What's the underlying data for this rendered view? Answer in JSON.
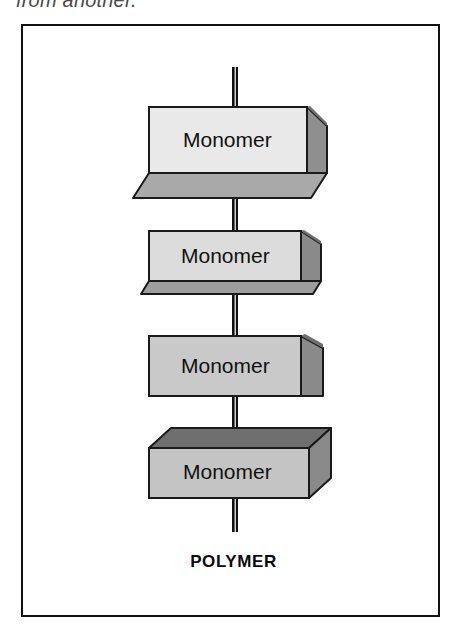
{
  "figure": {
    "caption_above": "from another.",
    "bottom_label": "POLYMER",
    "frame": {
      "border_color": "#121212",
      "background": "#ffffff"
    },
    "chain": {
      "bond_color": "#111111",
      "units": [
        {
          "label": "Monomer",
          "face_color": "#e9e9e9",
          "side_color": "#8f8f8f",
          "cap_color": "#a9a9a9",
          "cap": "bottom"
        },
        {
          "label": "Monomer",
          "face_color": "#dcdcdc",
          "side_color": "#8a8a8a",
          "cap_color": "#9e9e9e",
          "cap": "bottom"
        },
        {
          "label": "Monomer",
          "face_color": "#c9c9c9",
          "side_color": "#8a8a8a",
          "cap_color": "#9e9e9e",
          "cap": "none"
        },
        {
          "label": "Monomer",
          "face_color": "#c4c4c4",
          "side_color": "#8a8a8a",
          "cap_color": "#6f6f6f",
          "cap": "top"
        }
      ]
    }
  }
}
